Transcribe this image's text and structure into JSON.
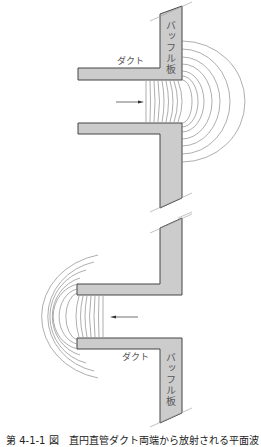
{
  "figure": {
    "caption": "第 4-1-1 図　直円直管ダクト両端から放射される平面波",
    "colors": {
      "wall_fill": "#cccccc",
      "wall_stroke": "#444444",
      "wave_stroke": "#777777",
      "arrow": "#333333"
    },
    "upper": {
      "duct_label": "ダクト",
      "baffle_label": "バッフル板",
      "arrow_direction": "right"
    },
    "lower": {
      "duct_label": "ダクト",
      "baffle_label": "バッフル板",
      "arrow_direction": "left"
    }
  }
}
